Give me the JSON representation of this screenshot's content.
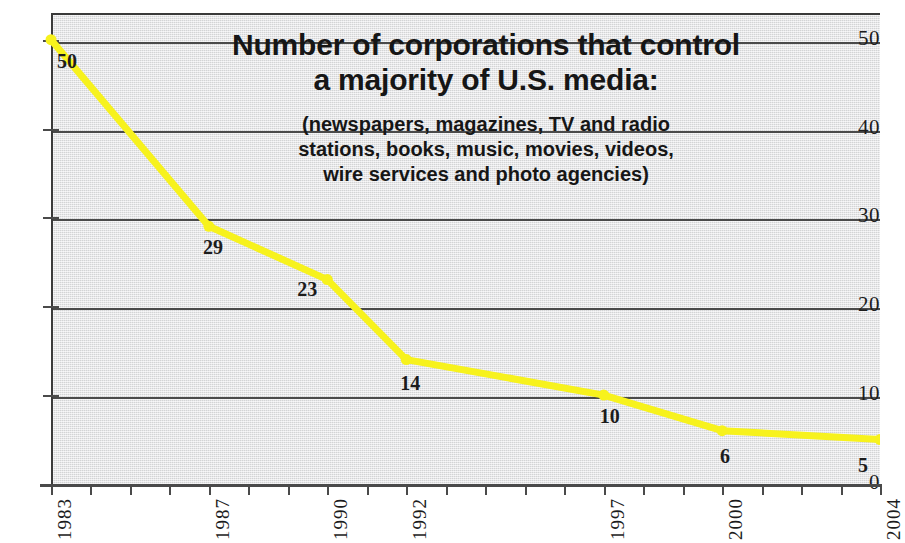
{
  "chart_data": {
    "type": "line",
    "title_lines": [
      "Number of corporations that control",
      "a majority of U.S. media:"
    ],
    "subtitle": "(newspapers, magazines, TV and radio stations, books, music, movies, videos, wire services and photo agencies)",
    "subtitle_lines": [
      "(newspapers, magazines, TV and radio",
      "stations, books, music, movies, videos,",
      "wire services and photo agencies)"
    ],
    "xlabel": "",
    "ylabel": "",
    "x": [
      1983,
      1987,
      1990,
      1992,
      1997,
      2000,
      2004
    ],
    "values": [
      50,
      29,
      23,
      14,
      10,
      6,
      5
    ],
    "point_labels": [
      "50",
      "29",
      "23",
      "14",
      "10",
      "6",
      "5"
    ],
    "series": [
      {
        "name": "Number of corporations",
        "values": [
          50,
          29,
          23,
          14,
          10,
          6,
          5
        ],
        "color": "#f7f21d"
      }
    ],
    "xtick_labels": [
      "1983",
      "1987",
      "1990",
      "1992",
      "1997",
      "2000",
      "2004"
    ],
    "xtick_values": [
      1983,
      1987,
      1990,
      1992,
      1997,
      2000,
      2004
    ],
    "xlim": [
      1983,
      2004
    ],
    "x_minor_ticks": [
      1983,
      1984,
      1985,
      1986,
      1987,
      1988,
      1989,
      1990,
      1991,
      1992,
      1993,
      1994,
      1995,
      1996,
      1997,
      1998,
      1999,
      2000,
      2001,
      2002,
      2003,
      2004
    ],
    "ytick_labels": [
      "0",
      "10",
      "20",
      "30",
      "40",
      "50"
    ],
    "ytick_values": [
      0,
      10,
      20,
      30,
      40,
      50
    ],
    "ylim": [
      0,
      53
    ],
    "grid": "horizontal",
    "legend": "none",
    "colors": {
      "line": "#f7f21d",
      "marker": "#f7f21d",
      "plot_background": "#e2e3e4",
      "gridline": "#4a4a4a",
      "axis": "#4a4a4a",
      "text": "#1c1c1c",
      "page_background": "#ffffff"
    }
  }
}
